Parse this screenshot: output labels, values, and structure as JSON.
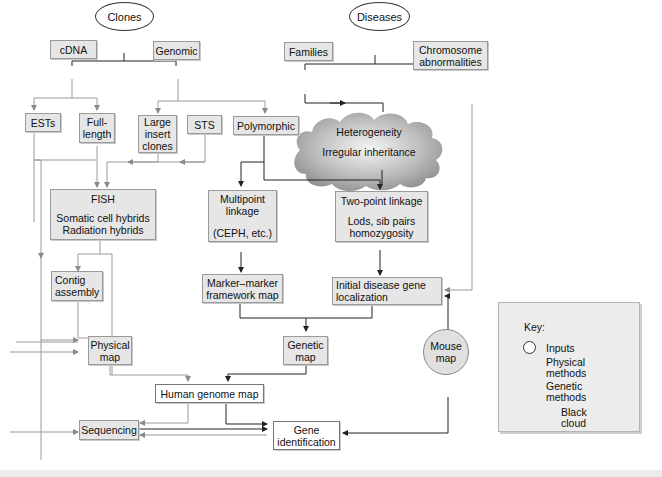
{
  "inputs": {
    "clones": "Clones",
    "diseases": "Diseases"
  },
  "nodes": {
    "cdna": "cDNA",
    "genomic": "Genomic",
    "ests": "ESTs",
    "full_length": [
      "Full-",
      "length"
    ],
    "large_insert": [
      "Large",
      "insert",
      "clones"
    ],
    "sts": "STS",
    "polymorphic": "Polymorphic",
    "families": "Families",
    "chromosome": [
      "Chromosome",
      "abnormalities"
    ],
    "fish": {
      "title": "FISH",
      "lines": [
        "Somatic cell hybrids",
        "Radiation hybrids"
      ]
    },
    "multipoint": {
      "lines": [
        "Multipoint",
        "linkage"
      ],
      "sub": "(CEPH, etc.)"
    },
    "twopoint": {
      "title": "Two-point linkage",
      "lines": [
        "Lods, sib pairs",
        "homozygosity"
      ]
    },
    "contig": [
      "Contig",
      "assembly"
    ],
    "marker": [
      "Marker–marker",
      "framework map"
    ],
    "initial": [
      "Initial disease gene",
      "localization"
    ],
    "physical_map": [
      "Physical",
      "map"
    ],
    "genetic_map": [
      "Genetic",
      "map"
    ],
    "mouse_map": [
      "Mouse",
      "map"
    ],
    "human_genome_map": "Human genome map",
    "sequencing": "Sequencing",
    "gene_identification": [
      "Gene",
      "identification"
    ]
  },
  "cloud": {
    "line1": "Heterogeneity",
    "line2": "Irregular inheritance"
  },
  "key": {
    "title": "Key:",
    "inputs": "Inputs",
    "physical": [
      "Physical",
      "methods"
    ],
    "genetic": [
      "Genetic",
      "methods"
    ],
    "cloud": [
      "Black",
      "cloud"
    ]
  },
  "colors": {
    "physical_line": "#9a9a9a",
    "genetic_line": "#222222",
    "box_fill": "#e6e6e6"
  }
}
